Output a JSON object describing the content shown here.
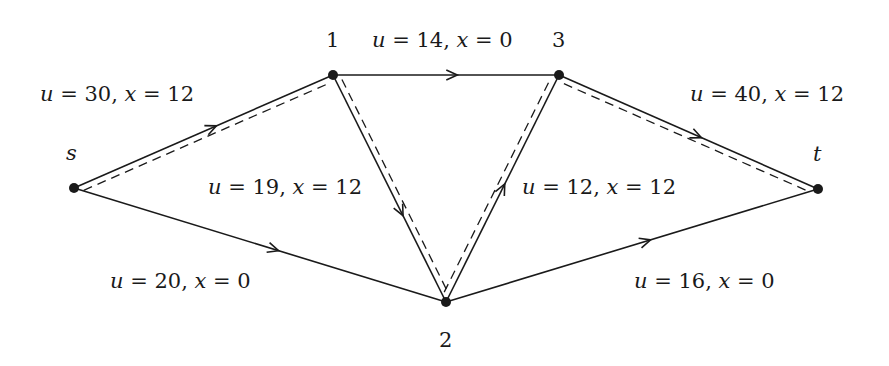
{
  "diagram": {
    "type": "flow-network",
    "nodes": [
      {
        "id": "s",
        "label": "s",
        "x": 74,
        "y": 188,
        "label_x": 66,
        "label_y": 143,
        "italic": true
      },
      {
        "id": "1",
        "label": "1",
        "x": 333,
        "y": 75,
        "label_x": 326,
        "label_y": 30,
        "italic": false
      },
      {
        "id": "3",
        "label": "3",
        "x": 559,
        "y": 75,
        "label_x": 552,
        "label_y": 30,
        "italic": false
      },
      {
        "id": "t",
        "label": "t",
        "x": 818,
        "y": 189,
        "label_x": 813,
        "label_y": 144,
        "italic": true
      },
      {
        "id": "2",
        "label": "2",
        "x": 446,
        "y": 302,
        "label_x": 439,
        "label_y": 330,
        "italic": false
      }
    ],
    "edges": [
      {
        "from": "s",
        "to": "1",
        "u": 30,
        "x": 12,
        "label": "u = 30, x = 12",
        "label_x": 40,
        "label_y": 84,
        "on_path": true
      },
      {
        "from": "1",
        "to": "3",
        "u": 14,
        "x": 0,
        "label": "u = 14, x = 0",
        "label_x": 372,
        "label_y": 30,
        "on_path": false
      },
      {
        "from": "1",
        "to": "2",
        "u": 19,
        "x": 12,
        "label": "u = 19, x = 12",
        "label_x": 208,
        "label_y": 177,
        "on_path": true
      },
      {
        "from": "2",
        "to": "3",
        "u": 12,
        "x": 12,
        "label": "u = 12, x = 12",
        "label_x": 522,
        "label_y": 177,
        "on_path": true
      },
      {
        "from": "3",
        "to": "t",
        "u": 40,
        "x": 12,
        "label": "u = 40, x = 12",
        "label_x": 690,
        "label_y": 84,
        "on_path": true
      },
      {
        "from": "s",
        "to": "2",
        "u": 20,
        "x": 0,
        "label": "u = 20, x = 0",
        "label_x": 110,
        "label_y": 271,
        "on_path": false
      },
      {
        "from": "2",
        "to": "t",
        "u": 16,
        "x": 0,
        "label": "u = 16, x = 0",
        "label_x": 634,
        "label_y": 271,
        "on_path": false
      }
    ],
    "path_style": "dashed",
    "path": [
      "s",
      "1",
      "2",
      "3",
      "t"
    ],
    "colors": {
      "line": "#1a1a1a",
      "background": "#ffffff"
    }
  }
}
